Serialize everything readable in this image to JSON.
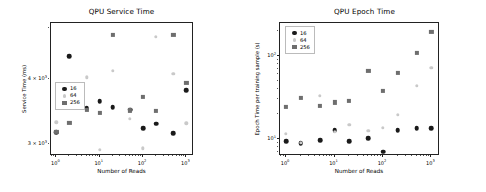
{
  "figure": {
    "width": 486,
    "height": 192,
    "background": "#ffffff"
  },
  "series_styles": {
    "16": {
      "color": "#1a1a1a",
      "marker": "circle"
    },
    "64": {
      "color": "#c9c9c9",
      "marker": "circle"
    },
    "256": {
      "color": "#6e6e6e",
      "marker": "square"
    }
  },
  "chart_data": [
    {
      "type": "scatter",
      "title": "QPU Service Time",
      "xlabel": "Number of Reads",
      "ylabel": "Service Time (ms)",
      "xscale": "log",
      "yscale": "log",
      "xlim": [
        0.75,
        1500
      ],
      "ylim": [
        2850,
        5100
      ],
      "grid": false,
      "legend_position": "center-left",
      "xticks": [
        1,
        10,
        100,
        1000
      ],
      "xtick_labels": [
        "10^0",
        "10^1",
        "10^2",
        "10^3"
      ],
      "yticks": [
        3000,
        4000
      ],
      "ytick_labels": [
        "3 x 10^3",
        "4 x 10^3"
      ],
      "x": [
        1,
        2,
        5,
        10,
        20,
        50,
        100,
        200,
        500,
        1000
      ],
      "series": [
        {
          "name": "16",
          "values": [
            3160,
            4410,
            3510,
            3620,
            3530,
            3490,
            3220,
            3280,
            3150,
            3800
          ]
        },
        {
          "name": "64",
          "values": [
            3300,
            3550,
            4020,
            2930,
            4140,
            3350,
            2950,
            4800,
            4080,
            3290
          ]
        },
        {
          "name": "256",
          "values": [
            3170,
            3290,
            3490,
            3440,
            4840,
            3480,
            3690,
            3470,
            4840,
            3930
          ]
        }
      ]
    },
    {
      "type": "scatter",
      "title": "QPU Epoch Time",
      "xlabel": "Number of Reads",
      "ylabel": "Epoch Time per training sample (s)",
      "xscale": "log",
      "yscale": "log",
      "xlim": [
        0.75,
        1500
      ],
      "ylim": [
        6.2,
        250
      ],
      "grid": false,
      "legend_position": "upper-left",
      "xticks": [
        1,
        10,
        100,
        1000
      ],
      "xtick_labels": [
        "10^0",
        "10^1",
        "10^2",
        "10^3"
      ],
      "yticks": [
        10,
        100
      ],
      "ytick_labels": [
        "10^1",
        "10^2"
      ],
      "x": [
        1,
        2,
        5,
        10,
        20,
        50,
        100,
        200,
        500,
        1000
      ],
      "series": [
        {
          "name": "16",
          "values": [
            9.4,
            8.9,
            9.6,
            12.8,
            9.4,
            10.1,
            7.0,
            12.8,
            13.4,
            13.4
          ]
        },
        {
          "name": "64",
          "values": [
            11.5,
            8.9,
            33.0,
            12.2,
            14.8,
            12.4,
            13.5,
            19.5,
            44.0,
            72.0
          ]
        },
        {
          "name": "256",
          "values": [
            24.0,
            31.0,
            25.0,
            27.5,
            28.5,
            66.0,
            38.0,
            63.0,
            110.0,
            195.0
          ]
        }
      ]
    }
  ]
}
